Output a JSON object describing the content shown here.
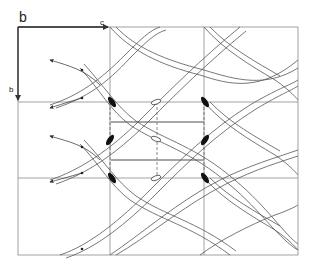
{
  "diagram": {
    "type": "crystallographic symmetry diagram",
    "axes": {
      "top_label": "b",
      "horizontal_axis_label": "c",
      "vertical_axis_label": "b"
    },
    "grid": {
      "columns": 3,
      "rows": 3,
      "x_lines": [
        18,
        110,
        204,
        298
      ],
      "y_lines": [
        27,
        102,
        178,
        255
      ]
    },
    "elements": {
      "twofold_screw_ellipses_filled": 6,
      "open_ellipses": 3,
      "horizontal_mirror_bars": 2,
      "dashed_guides": 3
    },
    "colors": {
      "line": "#555555",
      "frame": "#8a8a8a",
      "fill": "#111111",
      "background": "#ffffff"
    }
  }
}
